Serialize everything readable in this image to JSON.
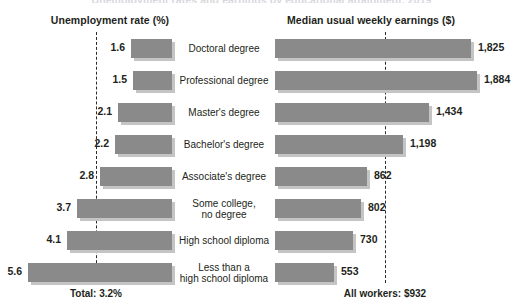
{
  "cutoff_title": "Unemployment rates and earnings by educational attainment, 2019",
  "headers": {
    "left": "Unemployment rate (%)",
    "right": "Median usual weekly earnings ($)"
  },
  "footers": {
    "left": "Total: 3.2%",
    "right": "All workers: $932"
  },
  "colors": {
    "bar": "#8a8a8a",
    "bar_shadow": "#c4c4c4",
    "text": "#231f20",
    "ref_line": "#2b2b2b"
  },
  "chart_data": {
    "type": "bar",
    "title": "Unemployment rates and earnings by educational attainment, 2019",
    "orientation": "horizontal",
    "grid": false,
    "legend": "none",
    "categories": [
      "Doctoral degree",
      "Professional degree",
      "Master's degree",
      "Bachelor's degree",
      "Associate's degree",
      "Some college,\nno degree",
      "High school diploma",
      "Less than a\nhigh school diploma"
    ],
    "series": [
      {
        "name": "Unemployment rate (%)",
        "axis_side": "left",
        "unit": "%",
        "values": [
          1.6,
          1.5,
          2.1,
          2.2,
          2.8,
          3.7,
          4.1,
          5.6
        ],
        "labels": [
          "1.6",
          "1.5",
          "2.1",
          "2.2",
          "2.8",
          "3.7",
          "4.1",
          "5.6"
        ],
        "xlim": [
          0,
          6.0
        ],
        "reference_line": {
          "label": "Total: 3.2%",
          "value": 3.2
        }
      },
      {
        "name": "Median usual weekly earnings ($)",
        "axis_side": "right",
        "unit": "$",
        "values": [
          1825,
          1884,
          1434,
          1198,
          862,
          802,
          730,
          553
        ],
        "labels": [
          "1,825",
          "1,884",
          "1,434",
          "1,198",
          "862",
          "802",
          "730",
          "553"
        ],
        "xlim": [
          0,
          2100
        ],
        "reference_line": {
          "label": "All workers: $932",
          "value": 932
        }
      }
    ]
  },
  "rows": [
    {
      "category": "Doctoral degree",
      "rate": "1.6",
      "earnings": "1,825"
    },
    {
      "category": "Professional degree",
      "rate": "1.5",
      "earnings": "1,884"
    },
    {
      "category": "Master's degree",
      "rate": "2.1",
      "earnings": "1,434"
    },
    {
      "category": "Bachelor's degree",
      "rate": "2.2",
      "earnings": "1,198"
    },
    {
      "category": "Associate's degree",
      "rate": "2.8",
      "earnings": "862"
    },
    {
      "category": "Some college,\nno degree",
      "rate": "3.7",
      "earnings": "802"
    },
    {
      "category": "High school diploma",
      "rate": "4.1",
      "earnings": "730"
    },
    {
      "category": "Less than a\nhigh school diploma",
      "rate": "5.6",
      "earnings": "553"
    }
  ]
}
